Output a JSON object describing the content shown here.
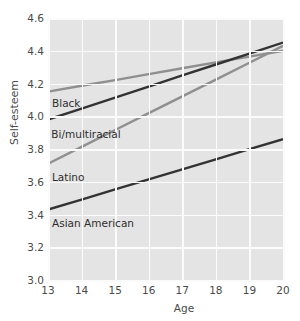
{
  "chart_data": {
    "type": "line",
    "title": "",
    "xlabel": "Age",
    "ylabel": "Self-esteem",
    "x": [
      13,
      14,
      15,
      16,
      17,
      18,
      19,
      20
    ],
    "xlim": [
      13,
      20
    ],
    "ylim": [
      3.0,
      4.6
    ],
    "xticks": [
      "13",
      "14",
      "15",
      "16",
      "17",
      "18",
      "19",
      "20"
    ],
    "yticks": [
      "4.6",
      "4.4",
      "4.2",
      "4.0",
      "3.8",
      "3.6",
      "3.4",
      "3.2",
      "3.0"
    ],
    "grid": true,
    "legend_position": "inline-labels",
    "series": [
      {
        "name": "Black",
        "color": "#8f8f8f",
        "label_text": "Black",
        "endpoints": [
          13,
          4.15,
          20,
          4.4
        ],
        "values": [
          4.15,
          4.186,
          4.221,
          4.257,
          4.293,
          4.329,
          4.364,
          4.4
        ]
      },
      {
        "name": "Bi/multiracial",
        "color": "#333333",
        "label_text": "Bi/multiracial",
        "endpoints": [
          13,
          3.98,
          20,
          4.45
        ],
        "values": [
          3.98,
          4.047,
          4.114,
          4.181,
          4.249,
          4.316,
          4.383,
          4.45
        ]
      },
      {
        "name": "Latino",
        "color": "#8f8f8f",
        "label_text": "Latino",
        "endpoints": [
          13,
          3.71,
          20,
          4.43
        ],
        "values": [
          3.71,
          3.813,
          3.916,
          4.019,
          4.121,
          4.224,
          4.327,
          4.43
        ]
      },
      {
        "name": "Asian American",
        "color": "#333333",
        "label_text": "Asian American",
        "endpoints": [
          13,
          3.43,
          20,
          3.86
        ],
        "values": [
          3.43,
          3.491,
          3.553,
          3.614,
          3.676,
          3.737,
          3.799,
          3.86
        ]
      }
    ]
  },
  "axes": {
    "y_title": "Self-esteem",
    "x_title": "Age"
  },
  "colors": {
    "panel_background": "#e4e4e4",
    "gridline": "#fbfbfb",
    "dark_series": "#333333",
    "light_series": "#8f8f8f",
    "text": "#4a4a4a",
    "page_background": "#ffffff"
  }
}
